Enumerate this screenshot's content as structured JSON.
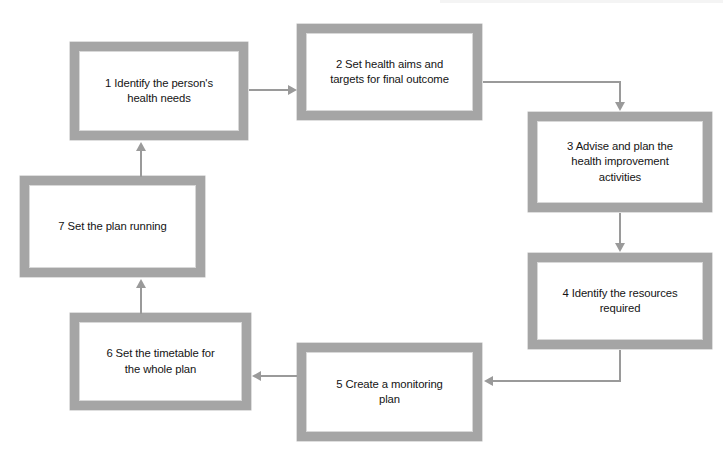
{
  "diagram": {
    "type": "flowchart",
    "title": "",
    "shape": "cycle",
    "background_color": "#ffffff",
    "node_border_color": "#a5a5a5",
    "node_fill_color": "#ffffff",
    "connector_color": "#9a9a9a",
    "text_color": "#141414",
    "nodes": [
      {
        "id": "step-1",
        "number": "1",
        "label": "1  Identify the person's\nhealth needs",
        "x": 70,
        "y": 42,
        "w": 178,
        "h": 98
      },
      {
        "id": "step-2",
        "number": "2",
        "label": "2  Set health aims and\ntargets for final outcome",
        "x": 297,
        "y": 24,
        "w": 185,
        "h": 96
      },
      {
        "id": "step-3",
        "number": "3",
        "label": "3  Advise and plan the\nhealth improvement\nactivities",
        "x": 528,
        "y": 112,
        "w": 184,
        "h": 100
      },
      {
        "id": "step-4",
        "number": "4",
        "label": "4  Identify the resources\nrequired",
        "x": 528,
        "y": 253,
        "w": 184,
        "h": 96
      },
      {
        "id": "step-5",
        "number": "5",
        "label": "5  Create a monitoring\nplan",
        "x": 297,
        "y": 343,
        "w": 185,
        "h": 98
      },
      {
        "id": "step-6",
        "number": "6",
        "label": "6  Set the timetable for\nthe whole plan",
        "x": 70,
        "y": 313,
        "w": 181,
        "h": 97
      },
      {
        "id": "step-7",
        "number": "7",
        "label": "7  Set the plan running",
        "x": 20,
        "y": 176,
        "w": 185,
        "h": 101
      }
    ],
    "connectors": [
      {
        "id": "conn-1-2",
        "from": "step-1",
        "to": "step-2",
        "direction": "right"
      },
      {
        "id": "conn-2-3",
        "from": "step-2",
        "to": "step-3",
        "direction": "right-then-down"
      },
      {
        "id": "conn-3-4",
        "from": "step-3",
        "to": "step-4",
        "direction": "down"
      },
      {
        "id": "conn-4-5",
        "from": "step-4",
        "to": "step-5",
        "direction": "down-then-left"
      },
      {
        "id": "conn-5-6",
        "from": "step-5",
        "to": "step-6",
        "direction": "left"
      },
      {
        "id": "conn-6-7",
        "from": "step-6",
        "to": "step-7",
        "direction": "up"
      },
      {
        "id": "conn-7-1",
        "from": "step-7",
        "to": "step-1",
        "direction": "up"
      }
    ]
  }
}
